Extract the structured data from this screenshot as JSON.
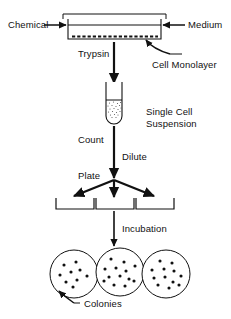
{
  "figure": {
    "type": "process-flow-diagram",
    "stroke_color": "#111111",
    "background_color": "#ffffff"
  },
  "labels": {
    "chemical": "Chemical",
    "medium": "Medium",
    "trypsin": "Trypsin",
    "cell_monolayer": "Cell Monolayer",
    "single_cell_suspension_line1": "Single Cell",
    "single_cell_suspension_line2": "Suspension",
    "count": "Count",
    "dilute": "Dilute",
    "plate": "Plate",
    "incubation": "Incubation",
    "colonies": "Colonies"
  },
  "stages": [
    {
      "id": "culture-flask",
      "name": "Culture flask with cell monolayer",
      "inputs": [
        "Chemical",
        "Medium"
      ],
      "annotations": [
        "Cell Monolayer"
      ]
    },
    {
      "id": "trypsinization",
      "name": "Trypsin treatment",
      "annotations": [
        "Trypsin"
      ]
    },
    {
      "id": "test-tube",
      "name": "Test tube of single cell suspension",
      "annotations": [
        "Single Cell Suspension"
      ]
    },
    {
      "id": "count-dilute-plate",
      "name": "Count, dilute and plate",
      "annotations": [
        "Count",
        "Dilute",
        "Plate"
      ]
    },
    {
      "id": "dishes",
      "name": "Three culture dishes",
      "count": 3
    },
    {
      "id": "incubation",
      "name": "Incubation",
      "annotations": [
        "Incubation"
      ]
    },
    {
      "id": "colony-plates",
      "name": "Three petri dishes with colonies",
      "count": 3,
      "annotations": [
        "Colonies"
      ]
    }
  ],
  "colony_plates": [
    {
      "index": 1,
      "colony_count": 9,
      "dots": [
        [
          -10,
          -9
        ],
        [
          2,
          -12
        ],
        [
          -14,
          1
        ],
        [
          -3,
          -2
        ],
        [
          6,
          -4
        ],
        [
          -8,
          8
        ],
        [
          3,
          6
        ],
        [
          13,
          2
        ],
        [
          -1,
          13
        ]
      ]
    },
    {
      "index": 2,
      "colony_count": 13,
      "dots": [
        [
          -9,
          -13
        ],
        [
          4,
          -10
        ],
        [
          -15,
          -3
        ],
        [
          -4,
          -4
        ],
        [
          6,
          -1
        ],
        [
          15,
          -6
        ],
        [
          -11,
          5
        ],
        [
          0,
          4
        ],
        [
          9,
          7
        ],
        [
          -6,
          13
        ],
        [
          5,
          14
        ],
        [
          14,
          9
        ],
        [
          -16,
          9
        ]
      ]
    },
    {
      "index": 3,
      "colony_count": 12,
      "dots": [
        [
          -6,
          -13
        ],
        [
          6,
          -11
        ],
        [
          -14,
          -4
        ],
        [
          -2,
          -5
        ],
        [
          8,
          -3
        ],
        [
          15,
          2
        ],
        [
          -12,
          4
        ],
        [
          -1,
          3
        ],
        [
          7,
          8
        ],
        [
          -8,
          11
        ],
        [
          3,
          14
        ],
        [
          13,
          11
        ]
      ]
    }
  ],
  "monolayer": {
    "dash_count": 17,
    "description": "dashed line of cells on flask floor"
  }
}
